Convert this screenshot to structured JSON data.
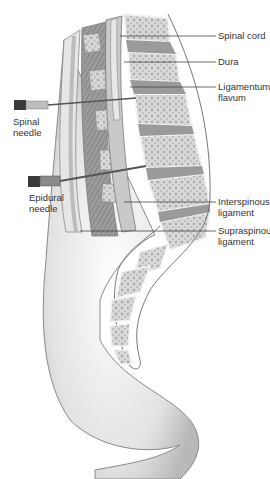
{
  "figure": {
    "labels": {
      "spinal_cord": "Spinal cord",
      "dura": "Dura",
      "ligamentum_flavum": "Ligamentum\nflavum",
      "interspinous": "Interspinous\nligament",
      "supraspinous": "Supraspinous\nligament",
      "spinal_needle": "Spinal\nneedle",
      "epidural_needle": "Epidural\nneedle"
    },
    "colors": {
      "skin": "#d9d9d9",
      "skin_edge": "#8a8a8a",
      "bone": "#cfcfcf",
      "disc": "#9a9a9a",
      "ligament": "#b5b5b5",
      "needle": "#555555",
      "leader": "#444444"
    }
  }
}
